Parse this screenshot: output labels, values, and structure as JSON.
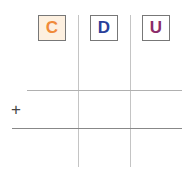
{
  "columns": [
    {
      "label": "C",
      "color": "#f08a3a",
      "bg": "#fdf0e0"
    },
    {
      "label": "D",
      "color": "#2a3f9a",
      "bg": "#ffffff"
    },
    {
      "label": "U",
      "color": "#8b2c6a",
      "bg": "#ffffff"
    }
  ],
  "add_symbol": "+"
}
